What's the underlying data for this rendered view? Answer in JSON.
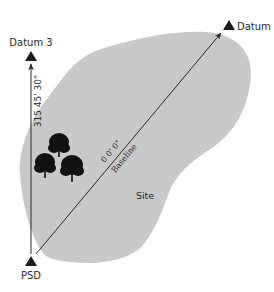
{
  "diagram": {
    "type": "site survey baseline diagram",
    "colors": {
      "site_fill": "#c9c9c9",
      "line": "#2b2b2b",
      "marker": "#1e1e1e",
      "tree": "#111111",
      "text": "#2a2a2a"
    },
    "points": [
      {
        "id": "psd",
        "label": "PSD",
        "x": 31,
        "y": 258
      },
      {
        "id": "datum3",
        "label": "Datum 3",
        "x": 31,
        "y": 58
      },
      {
        "id": "datum2",
        "label": "Datum 2",
        "x": 226,
        "y": 26
      }
    ],
    "lines": [
      {
        "id": "azimuth-line",
        "from": "psd",
        "to": "datum3",
        "label": "315 45' 30\""
      },
      {
        "id": "baseline",
        "from": "psd",
        "to": "datum2",
        "angle_label": "0 0' 0\"",
        "name_label": "Baseline"
      }
    ],
    "area": {
      "label": "Site"
    },
    "features": [
      {
        "type": "tree",
        "count": 3
      }
    ]
  },
  "labels": {
    "psd": "PSD",
    "datum3": "Datum 3",
    "datum2": "Datum 2",
    "azimuth": "315 45' 30\"",
    "baseline_angle": "0 0' 0\"",
    "baseline_name": "Baseline",
    "site": "Site"
  }
}
